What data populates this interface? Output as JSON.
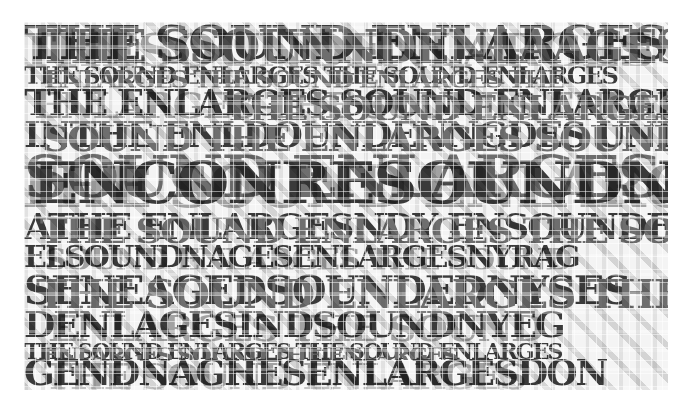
{
  "artwork": {
    "description": "Fragmented typographic collage of layered serif capitals in grayscale",
    "palette": [
      "#3a3a3a",
      "#6e6e6e",
      "#a9a9a9",
      "#cfcfcf",
      "#f4f4f4"
    ],
    "rows": [
      {
        "id": "row1",
        "top": 0,
        "height": 44,
        "size": 46,
        "layers": [
          {
            "tone": "dark",
            "text": "THE SOUND ENLARGES",
            "dx": 0,
            "dy": -2,
            "sx": 1.08
          },
          {
            "tone": "mid",
            "text": "THE SSOUNNDENLAAGES",
            "dx": 14,
            "dy": 2,
            "sx": 1.0
          },
          {
            "tone": "light",
            "text": "THESOUNDENLARGES",
            "dx": -6,
            "dy": 6,
            "sx": 1.12
          }
        ]
      },
      {
        "id": "row2",
        "top": 42,
        "height": 24,
        "size": 24,
        "layers": [
          {
            "tone": "dark",
            "text": "THE SOUND ENLARGES THE SOUND ENLARGES",
            "dx": 0,
            "dy": 0,
            "sx": 1.0
          },
          {
            "tone": "mid",
            "text": "ENLARGES THE SOUND ENLARGES THE",
            "dx": 20,
            "dy": 4,
            "sx": 1.05
          }
        ]
      },
      {
        "id": "row3",
        "top": 62,
        "height": 36,
        "size": 36,
        "layers": [
          {
            "tone": "dark",
            "text": "THE ENLARGES SOUND ENLARGES SOU",
            "dx": 0,
            "dy": 0,
            "sx": 1.0
          },
          {
            "tone": "light",
            "text": "ENLARGES THE SOUNDS ENLARGE",
            "dx": 10,
            "dy": 3,
            "sx": 1.04
          },
          {
            "tone": "mid",
            "text": "THE SOUND ENLARGES",
            "dx": 200,
            "dy": 6,
            "sx": 1.0
          }
        ]
      },
      {
        "id": "row4",
        "top": 94,
        "height": 36,
        "size": 36,
        "layers": [
          {
            "tone": "dark",
            "text": "INTHE ENLDOUNDENNGDES UNDTE",
            "dx": 0,
            "dy": 0,
            "sx": 1.0
          },
          {
            "tone": "mid",
            "text": "SOUND THE ENLARGES SOUND",
            "dx": 18,
            "dy": 4,
            "sx": 1.05
          }
        ]
      },
      {
        "id": "row5",
        "top": 130,
        "height": 58,
        "size": 58,
        "layers": [
          {
            "tone": "mid",
            "text": "SOUND ENLARGES SOUND",
            "dx": 0,
            "dy": -4,
            "sx": 1.05
          },
          {
            "tone": "dark",
            "text": "ENCONRESOUNDN",
            "dx": 8,
            "dy": 2,
            "sx": 1.05
          },
          {
            "tone": "light",
            "text": "THE SOUND ENLARGES SOUNDS",
            "dx": -10,
            "dy": 6,
            "sx": 1.0
          }
        ]
      },
      {
        "id": "row6",
        "top": 186,
        "height": 36,
        "size": 36,
        "layers": [
          {
            "tone": "dark",
            "text": "ATHE ENLARGESNDY ENSOUNDE",
            "dx": 0,
            "dy": 0,
            "sx": 1.0
          },
          {
            "tone": "mid",
            "text": "THE SOUND ENLARGES THE SOUND",
            "dx": 16,
            "dy": 4,
            "sx": 1.03
          }
        ]
      },
      {
        "id": "row7",
        "top": 220,
        "height": 30,
        "size": 30,
        "layers": [
          {
            "tone": "dark",
            "text": "ELSOUNDNAGESENLARGESNYRAG",
            "dx": 0,
            "dy": 0,
            "sx": 1.0
          },
          {
            "tone": "light",
            "text": "SOUND ENLARGES THE SOUND",
            "dx": 20,
            "dy": 3,
            "sx": 1.05
          }
        ]
      },
      {
        "id": "row8",
        "top": 248,
        "height": 40,
        "size": 40,
        "layers": [
          {
            "tone": "dark",
            "text": "SENEAGEDSOUNDEDNYSES",
            "dx": 0,
            "dy": 0,
            "sx": 1.0
          },
          {
            "tone": "mid",
            "text": "THE SOUND ENLARGES THE",
            "dx": 12,
            "dy": 4,
            "sx": 1.05
          }
        ]
      },
      {
        "id": "row9",
        "top": 284,
        "height": 36,
        "size": 36,
        "layers": [
          {
            "tone": "dark",
            "text": "DENLAGESINDSOUNDNYEG",
            "dx": 0,
            "dy": 0,
            "sx": 1.0
          },
          {
            "tone": "light",
            "text": "ENLARGES THE SOUND",
            "dx": 24,
            "dy": 4,
            "sx": 1.08
          }
        ]
      },
      {
        "id": "row10",
        "top": 318,
        "height": 20,
        "size": 22,
        "layers": [
          {
            "tone": "dark",
            "text": "THE SOUND ENLARGES THE SOUND ENLARGES",
            "dx": 0,
            "dy": 0,
            "sx": 1.0
          },
          {
            "tone": "mid",
            "text": "ENLARGES SOUND THE ENLARGES",
            "dx": 18,
            "dy": 4,
            "sx": 1.05
          }
        ]
      },
      {
        "id": "row11",
        "top": 334,
        "height": 34,
        "size": 36,
        "layers": [
          {
            "tone": "dark",
            "text": "GENDNAGHESENLARGESDON",
            "dx": 0,
            "dy": -2,
            "sx": 1.0
          },
          {
            "tone": "light",
            "text": "THE SOUND ENLARGES",
            "dx": 20,
            "dy": 2,
            "sx": 1.05
          }
        ]
      }
    ]
  }
}
